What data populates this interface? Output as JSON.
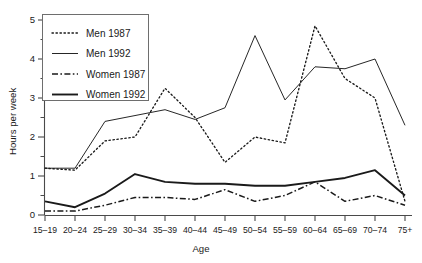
{
  "chart_data": {
    "type": "line",
    "title": "",
    "xlabel": "Age",
    "ylabel": "Hours per week",
    "categories": [
      "15–19",
      "20–24",
      "25–29",
      "30–34",
      "35–39",
      "40–44",
      "45–49",
      "50–54",
      "55–59",
      "60–64",
      "65–69",
      "70–74",
      "75+"
    ],
    "ylim": [
      0,
      5
    ],
    "yticks": [
      0,
      1,
      2,
      3,
      4,
      5
    ],
    "ytick_labels": [
      "0",
      "1",
      "2",
      "3",
      "4",
      "5"
    ],
    "yminor_step": 0.5,
    "grid": false,
    "legend_position": "upper-left",
    "series": [
      {
        "name": "Men 1987",
        "style": "dotted",
        "values": [
          1.2,
          1.15,
          1.9,
          2.0,
          3.25,
          2.5,
          1.35,
          2.0,
          1.85,
          4.85,
          3.5,
          3.0,
          0.35
        ]
      },
      {
        "name": "Men 1992",
        "style": "thin-solid",
        "values": [
          1.2,
          1.2,
          2.4,
          2.55,
          2.7,
          2.45,
          2.75,
          4.6,
          2.95,
          3.8,
          3.75,
          4.0,
          2.3
        ]
      },
      {
        "name": "Women 1987",
        "style": "dash-dot",
        "values": [
          0.1,
          0.1,
          0.25,
          0.45,
          0.45,
          0.4,
          0.65,
          0.35,
          0.5,
          0.85,
          0.35,
          0.5,
          0.25
        ]
      },
      {
        "name": "Women 1992",
        "style": "thick-solid",
        "values": [
          0.35,
          0.2,
          0.55,
          1.05,
          0.85,
          0.8,
          0.8,
          0.75,
          0.75,
          0.85,
          0.95,
          1.15,
          0.5
        ]
      }
    ]
  },
  "legend": {
    "items": [
      {
        "label": "Men 1987",
        "style": "dotted"
      },
      {
        "label": "Men 1992",
        "style": "thin-solid"
      },
      {
        "label": "Women 1987",
        "style": "dash-dot"
      },
      {
        "label": "Women 1992",
        "style": "thick-solid"
      }
    ]
  },
  "axes": {
    "y_title": "Hours per week",
    "x_title": "Age"
  }
}
